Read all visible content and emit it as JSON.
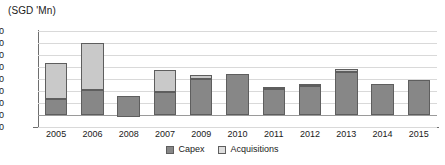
{
  "chart_data": {
    "type": "bar",
    "title": "(SGD 'Mn)",
    "subtitle": "",
    "xlabel": "",
    "ylabel": "",
    "stacked": true,
    "grid": true,
    "legend_position": "bottom",
    "ylim": [
      -100,
      700
    ],
    "yticks": [
      700,
      600,
      500,
      400,
      300,
      200,
      100,
      0,
      -100
    ],
    "ytick_labels": [
      "700",
      "600",
      "500",
      "400",
      "300",
      "200",
      "100",
      "0",
      "-100"
    ],
    "categories": [
      "2005",
      "2006",
      "2008",
      "2007",
      "2009",
      "2010",
      "2011",
      "2012",
      "2013",
      "2014",
      "2015"
    ],
    "series": [
      {
        "name": "Capex",
        "color": "#878787",
        "values": [
          130,
          205,
          170,
          195,
          300,
          345,
          215,
          240,
          355,
          255,
          290
        ]
      },
      {
        "name": "Acquisitions",
        "color": "#c9c9c9",
        "values": [
          300,
          395,
          0,
          180,
          30,
          0,
          20,
          20,
          30,
          0,
          0
        ]
      }
    ],
    "bar_bases": [
      0,
      0,
      -15,
      0,
      0,
      0,
      0,
      0,
      0,
      0,
      0
    ],
    "totals": [
      430,
      600,
      170,
      375,
      330,
      345,
      235,
      260,
      385,
      255,
      290
    ],
    "legend_entries": [
      {
        "label": "Capex",
        "swatch": "capex"
      },
      {
        "label": "Acquisitions",
        "swatch": "acq"
      }
    ],
    "colors": {
      "capex": "#878787",
      "acquisitions": "#c9c9c9",
      "grid": "#d9d9d9",
      "axis": "#6e6e6e",
      "bar_border": "#5e5e5e",
      "text": "#1a1a1a",
      "background": "#ffffff"
    }
  }
}
